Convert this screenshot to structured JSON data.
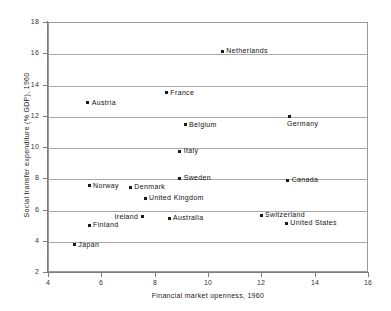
{
  "chart_data": {
    "type": "scatter",
    "title": "",
    "xlabel": "Financial market openness, 1960",
    "ylabel": "Social transfer expenditure (% GDP), 1960",
    "xlim": [
      4,
      16
    ],
    "ylim": [
      2,
      18
    ],
    "xticks": [
      "4",
      "6",
      "8",
      "10",
      "12",
      "14",
      "16"
    ],
    "yticks": [
      "2",
      "4",
      "6",
      "8",
      "10",
      "12",
      "14",
      "16",
      "18"
    ],
    "xtick_values": [
      4,
      6,
      8,
      10,
      12,
      14,
      16
    ],
    "ytick_values": [
      2,
      4,
      6,
      8,
      10,
      12,
      14,
      16,
      18
    ],
    "grid": "horizontal",
    "legend": "none",
    "marker_color": "#1a1a1a",
    "grid_color": "#a8a8a8",
    "axis_color": "#7d7d7d",
    "points": [
      {
        "label": "Netherlands",
        "x": 10.5,
        "y": 16.2,
        "label_pos": "right"
      },
      {
        "label": "France",
        "x": 8.4,
        "y": 13.55,
        "label_pos": "right"
      },
      {
        "label": "Austria",
        "x": 5.45,
        "y": 12.9,
        "label_pos": "right"
      },
      {
        "label": "Germany",
        "x": 13.0,
        "y": 12.0,
        "label_pos": "below"
      },
      {
        "label": "Belgium",
        "x": 9.1,
        "y": 11.5,
        "label_pos": "right"
      },
      {
        "label": "Italy",
        "x": 8.9,
        "y": 9.8,
        "label_pos": "right"
      },
      {
        "label": "Sweden",
        "x": 8.9,
        "y": 8.05,
        "label_pos": "right"
      },
      {
        "label": "Canada",
        "x": 12.95,
        "y": 7.95,
        "label_pos": "right"
      },
      {
        "label": "Norway",
        "x": 5.5,
        "y": 7.6,
        "label_pos": "right"
      },
      {
        "label": "Denmark",
        "x": 7.05,
        "y": 7.5,
        "label_pos": "right"
      },
      {
        "label": "United Kingdom",
        "x": 7.6,
        "y": 6.8,
        "label_pos": "right"
      },
      {
        "label": "Switzerland",
        "x": 11.95,
        "y": 5.7,
        "label_pos": "right"
      },
      {
        "label": "Ireland",
        "x": 7.5,
        "y": 5.6,
        "label_pos": "left"
      },
      {
        "label": "Australia",
        "x": 8.5,
        "y": 5.5,
        "label_pos": "right"
      },
      {
        "label": "United States",
        "x": 12.9,
        "y": 5.2,
        "label_pos": "right"
      },
      {
        "label": "Finland",
        "x": 5.5,
        "y": 5.05,
        "label_pos": "right"
      },
      {
        "label": "Japan",
        "x": 4.95,
        "y": 3.8,
        "label_pos": "right"
      }
    ]
  }
}
